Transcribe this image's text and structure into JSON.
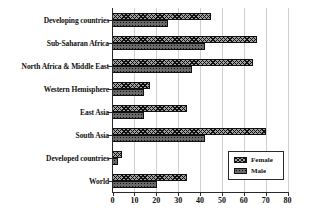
{
  "chart_data": {
    "type": "bar",
    "orientation": "horizontal",
    "title": "",
    "xlabel": "",
    "ylabel": "",
    "categories": [
      "Developing countries",
      "Sub-Saharan Africa",
      "North Africa & Middle East",
      "Western Hemisphere",
      "East Asia",
      "South Asia",
      "Developed countries",
      "World"
    ],
    "series": [
      {
        "name": "Female",
        "pattern": "crosshatch",
        "fill": "#a2a2a2",
        "values": [
          45,
          66,
          64,
          17,
          34,
          70,
          4,
          34
        ]
      },
      {
        "name": "Male",
        "pattern": "dots",
        "fill": "#6a6a6a",
        "values": [
          25,
          42,
          36,
          14,
          14,
          42,
          2.5,
          20
        ]
      }
    ],
    "xlim": [
      0,
      80
    ],
    "xticks": [
      0,
      10,
      20,
      30,
      40,
      50,
      60,
      70,
      80
    ],
    "grid": true,
    "legend_position": "inside-bottom-right",
    "colors": {
      "axis": "#2a2a2a",
      "gridline": "#cfcfcf",
      "text": "#111111",
      "background": "#ffffff"
    }
  }
}
